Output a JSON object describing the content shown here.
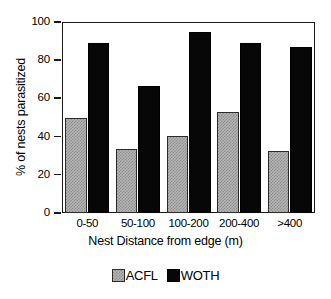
{
  "chart_data": {
    "type": "bar",
    "title": "",
    "subtitle": "",
    "xlabel": "Nest Distance from edge (m)",
    "ylabel": "% of nests parasitized",
    "categories": [
      "0-50",
      "50-100",
      "100-200",
      "200-400",
      ">400"
    ],
    "series": [
      {
        "name": "ACFL",
        "color": "#b4b4b4",
        "values": [
          50,
          33.5,
          40.3,
          53,
          32.5
        ]
      },
      {
        "name": "WOTH",
        "color": "#070707",
        "values": [
          89,
          66.5,
          94.8,
          89,
          87
        ]
      }
    ],
    "ylim": [
      0,
      100
    ],
    "yticks": [
      0,
      20,
      40,
      60,
      80,
      100
    ],
    "ytick_labels": [
      "0",
      "20",
      "40",
      "60",
      "80",
      "100"
    ],
    "grid": false,
    "legend_position": "bottom",
    "legend_entries": [
      "ACFL",
      "WOTH"
    ],
    "frame": "box"
  },
  "axis": {
    "y_title": "% of nests parasitized",
    "x_title": "Nest Distance from edge (m)"
  },
  "legend": {
    "items": [
      {
        "label": "ACFL",
        "swatch": "gray-hatched-swatch"
      },
      {
        "label": "WOTH",
        "swatch": "black-swatch"
      }
    ]
  }
}
